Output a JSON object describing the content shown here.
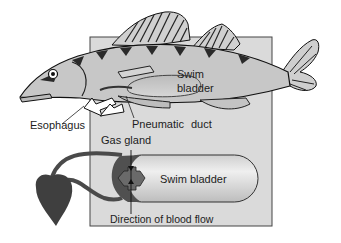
{
  "figure": {
    "labels": {
      "swim_bladder_upper_line1": "Swim",
      "swim_bladder_upper_line2": "bladder",
      "esophagus": "Esophagus",
      "pneumatic": "Pneumatic",
      "duct": "duct",
      "gas_gland": "Gas gland",
      "swim_bladder_lower": "Swim bladder",
      "blood_flow": "Direction of blood flow"
    },
    "colors": {
      "background": "#ffffff",
      "panel": "#d9d9d9",
      "panel_border": "#555555",
      "fish_body": "#c8c8c8",
      "fish_outline": "#1a1a1a",
      "bladder_light": "#e6e6e6",
      "bladder_dark": "#bdbdbd",
      "gland": "#5a5a5a",
      "heart": "#3f3f3f",
      "vessel": "#4a4a4a"
    }
  }
}
